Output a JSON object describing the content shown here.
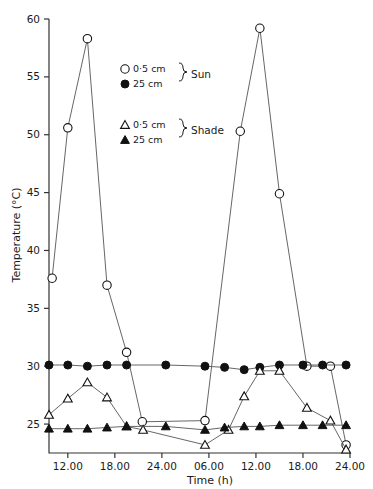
{
  "chart_data": {
    "type": "line",
    "title": "",
    "xlabel": "Time (h)",
    "ylabel": "Temperature (°C)",
    "xlim": [
      9,
      24
    ],
    "ylim": [
      22.5,
      60
    ],
    "grid": false,
    "legend_position": "inside-upper-left",
    "x_ticks": [
      12,
      18,
      24,
      30,
      36,
      42,
      48
    ],
    "x_tick_labels": [
      "12.00",
      "18.00",
      "24.00",
      "06.00",
      "12.00",
      "18.00",
      "24.00"
    ],
    "y_ticks": [
      25,
      30,
      35,
      40,
      45,
      50,
      55,
      60
    ],
    "y_tick_labels": [
      "25",
      "30",
      "35",
      "40",
      "45",
      "50",
      "55",
      "60"
    ],
    "series": [
      {
        "name": "Sun 0·5 cm",
        "marker": "open-circle",
        "x": [
          10,
          12,
          14.5,
          17,
          19.5,
          21.5,
          29.5,
          34,
          36.5,
          39,
          42.5,
          45.5,
          47.5
        ],
        "values": [
          37.6,
          50.6,
          58.3,
          37.0,
          31.2,
          25.2,
          25.3,
          50.3,
          59.2,
          44.9,
          30.0,
          30.0,
          23.2
        ]
      },
      {
        "name": "Sun 25 cm",
        "marker": "filled-circle",
        "x": [
          9.6,
          12,
          14.5,
          17,
          19.5,
          24.5,
          29.5,
          32,
          34.5,
          36.5,
          39,
          42,
          44.5,
          47.5
        ],
        "values": [
          30.1,
          30.1,
          30.0,
          30.1,
          30.1,
          30.1,
          30.0,
          29.9,
          29.7,
          29.9,
          30.1,
          30.1,
          30.1,
          30.1
        ]
      },
      {
        "name": "Shade 0·5 cm",
        "marker": "open-triangle",
        "x": [
          9.6,
          12,
          14.5,
          17,
          19.5,
          21.6,
          29.5,
          32.5,
          34.5,
          36.5,
          39,
          42.5,
          45.5,
          47.5
        ],
        "values": [
          25.8,
          27.2,
          28.6,
          27.3,
          24.8,
          24.5,
          23.2,
          24.5,
          27.4,
          29.6,
          29.6,
          26.4,
          25.3,
          22.8
        ]
      },
      {
        "name": "Shade 25 cm",
        "marker": "filled-triangle",
        "x": [
          9.6,
          12,
          14.5,
          17,
          19.5,
          24.5,
          29.5,
          32,
          34.5,
          36.5,
          39,
          42,
          44.5,
          47.5
        ],
        "values": [
          24.6,
          24.6,
          24.6,
          24.7,
          24.8,
          24.8,
          24.5,
          24.7,
          24.8,
          24.8,
          24.9,
          24.9,
          24.9,
          24.9
        ]
      }
    ],
    "legend": {
      "rows": [
        {
          "marker": "open-circle",
          "label": "0·5 cm",
          "group": "Sun"
        },
        {
          "marker": "filled-circle",
          "label": "25 cm",
          "group": "Sun"
        },
        {
          "marker": "open-triangle",
          "label": "0·5 cm",
          "group": "Shade"
        },
        {
          "marker": "filled-triangle",
          "label": "25 cm",
          "group": "Shade"
        }
      ],
      "group_sun": "Sun",
      "group_shade": "Shade"
    },
    "colors": {
      "line": "#555555",
      "marker_fill": "#111111",
      "axis": "#333333",
      "text": "#1a1a1a",
      "background": "#ffffff"
    }
  }
}
